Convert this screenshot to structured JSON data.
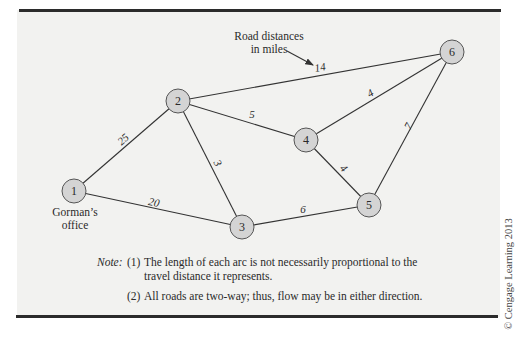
{
  "diagram": {
    "annotation": {
      "line1": "Road distances",
      "line2": "in miles"
    },
    "nodes": [
      {
        "id": "1",
        "label": "1",
        "x": 74,
        "y": 191
      },
      {
        "id": "2",
        "label": "2",
        "x": 178,
        "y": 101
      },
      {
        "id": "3",
        "label": "3",
        "x": 242,
        "y": 227
      },
      {
        "id": "4",
        "label": "4",
        "x": 306,
        "y": 140
      },
      {
        "id": "5",
        "label": "5",
        "x": 369,
        "y": 205
      },
      {
        "id": "6",
        "label": "6",
        "x": 452,
        "y": 52
      }
    ],
    "node_caption": {
      "node": "1",
      "line1": "Gorman’s",
      "line2": "office"
    },
    "edges": [
      {
        "from": "1",
        "to": "2",
        "distance": "25"
      },
      {
        "from": "1",
        "to": "3",
        "distance": "20"
      },
      {
        "from": "2",
        "to": "3",
        "distance": "3"
      },
      {
        "from": "2",
        "to": "4",
        "distance": "5"
      },
      {
        "from": "2",
        "to": "6",
        "distance": "14"
      },
      {
        "from": "3",
        "to": "5",
        "distance": "6"
      },
      {
        "from": "4",
        "to": "5",
        "distance": "4"
      },
      {
        "from": "4",
        "to": "6",
        "distance": "4"
      },
      {
        "from": "5",
        "to": "6",
        "distance": "7"
      }
    ],
    "note": {
      "label": "Note:",
      "item1_num": "(1)",
      "item1_line1": "The length of each arc is not necessarily proportional to the",
      "item1_line2": "travel distance it represents.",
      "item2_num": "(2)",
      "item2_text": "All roads are two-way; thus, flow may be in either direction."
    },
    "copyright": "© Cengage Learning 2013",
    "colors": {
      "node_fill": "#d4d4d4",
      "node_stroke": "#555555",
      "edge": "#333333",
      "panel_bg": "#f2f2f0",
      "rule": "#2b2b2b"
    }
  }
}
